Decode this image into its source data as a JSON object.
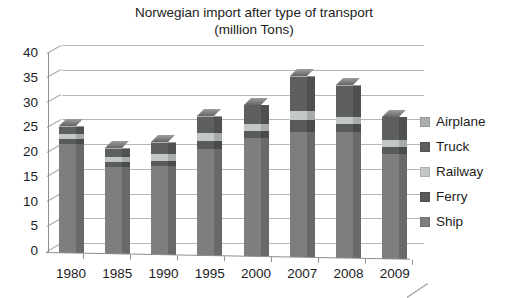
{
  "title": {
    "line1": "Norwegian import after type of transport",
    "line2": "(million Tons)"
  },
  "chart_data": {
    "type": "bar",
    "variant": "stacked-pseudo-3d",
    "title": "Norwegian import after type of transport (million Tons)",
    "unit": "million Tons",
    "categories": [
      "1980",
      "1985",
      "1990",
      "1995",
      "2000",
      "2007",
      "2008",
      "2009"
    ],
    "series": [
      {
        "name": "Ship",
        "color": "#7d7f7f",
        "side_color": "#686a6a",
        "values": [
          22.0,
          17.5,
          18.0,
          21.5,
          24.0,
          25.4,
          25.4,
          21.3
        ]
      },
      {
        "name": "Ferry",
        "color": "#595b5b",
        "side_color": "#4a4c4c",
        "values": [
          1.0,
          1.0,
          1.0,
          1.7,
          1.4,
          2.4,
          1.7,
          1.4
        ]
      },
      {
        "name": "Railway",
        "color": "#c4c8c5",
        "side_color": "#a8aca9",
        "values": [
          1.0,
          1.0,
          1.3,
          1.6,
          1.4,
          1.7,
          1.4,
          1.4
        ]
      },
      {
        "name": "Truck",
        "color": "#5e6060",
        "side_color": "#4f5151",
        "values": [
          1.5,
          1.7,
          2.3,
          3.2,
          3.7,
          7.0,
          6.3,
          4.5
        ]
      },
      {
        "name": "Airplane",
        "color": "#aaafac",
        "side_color": "#949996",
        "values": [
          0.1,
          0.1,
          0.1,
          0.1,
          0.1,
          0.1,
          0.1,
          0.1
        ]
      }
    ],
    "totals_approx": [
      25.6,
      21.3,
      22.7,
      28.1,
      30.6,
      36.6,
      34.9,
      28.7
    ],
    "y_axis": {
      "min": 0,
      "max": 40,
      "step": 5,
      "tick_labels": [
        "40",
        "35",
        "30",
        "25",
        "20",
        "15",
        "10",
        "5",
        "0"
      ]
    },
    "x_axis": {
      "tick_labels": [
        "1980",
        "1985",
        "1990",
        "1995",
        "2000",
        "2007",
        "2008",
        "2009"
      ]
    },
    "legend": {
      "position": "right",
      "order_top_to_bottom": [
        "Airplane",
        "Truck",
        "Railway",
        "Ferry",
        "Ship"
      ]
    },
    "grid": true,
    "top_face_colors": {
      "light": "#9c9e9e",
      "dark": "#646666"
    },
    "colors": {
      "gridline": "#b7b7b7",
      "axis": "#8f8f8f",
      "text": "#1c1c1c",
      "background": "#ffffff"
    }
  }
}
